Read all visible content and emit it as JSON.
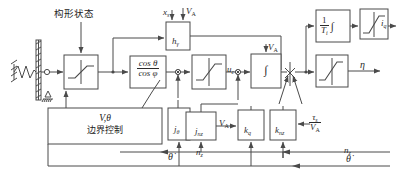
{
  "diagram": {
    "title_note": "控制系统框图",
    "annotations": {
      "config_state": "构形状态",
      "boundary_ctrl_line1": "V,θ",
      "boundary_ctrl_line2": "边界控制"
    },
    "blocks": {
      "saturation1": "↗",
      "cos_ratio_num": "cos θ",
      "cos_ratio_den": "cos φ",
      "saturation2": "↗",
      "h_gamma": "h",
      "h_gamma_sub": "γ",
      "integrator": "∫",
      "gain_T": "1",
      "gain_T_den": "T",
      "gain_T_den_sub": "i",
      "gain_T_int": "∫",
      "saturation3": "↗",
      "saturation4": "↗",
      "j_theta": "j",
      "j_theta_sub": "θ",
      "j_nz": "j",
      "j_nz_sub": "nz",
      "k_q": "k",
      "k_q_sub": "q",
      "k_nz": "k",
      "k_nz_sub": "nz"
    },
    "signals": {
      "x_s": "x",
      "x_s_sub": "s",
      "V_A_1": "V",
      "V_A_1_sub": "A",
      "V_A_2": "V",
      "V_A_2_sub": "A",
      "V_A_3": "V",
      "V_A_3_sub": "A",
      "u_c": "u",
      "u_c_sub": "c",
      "i_q": "i",
      "i_q_sub": "q",
      "eta": "η",
      "n_z_in": "n",
      "n_z_in_sub": "z",
      "n_z_fb": "n",
      "n_z_fb_sub": "z",
      "theta_dot_left": "θ̇",
      "theta_dot_right": "θ̇",
      "tau_s_num": "τ",
      "tau_s_num_sub": "s",
      "tau_s_den": "V",
      "tau_s_den_sub": "A"
    },
    "colors": {
      "line": "#4a4a4a",
      "text": "#2b2b2b",
      "background": "#ffffff"
    }
  }
}
